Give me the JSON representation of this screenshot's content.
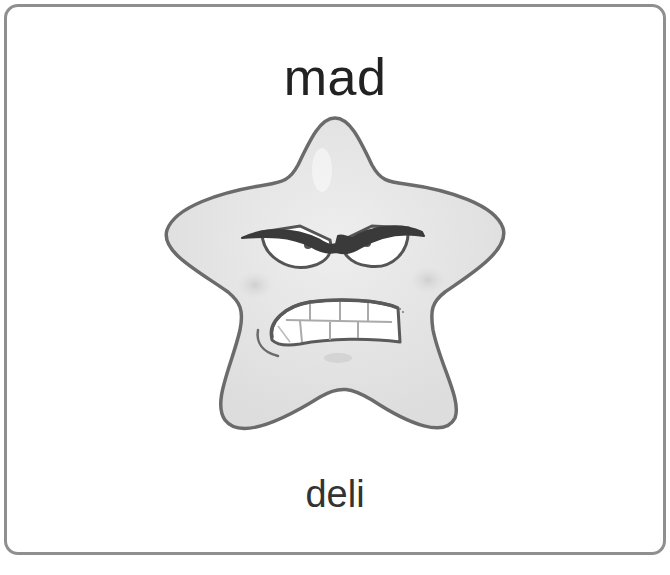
{
  "card": {
    "title": "mad",
    "subtitle": "deli",
    "border_color": "#8f8f8f",
    "background": "#ffffff"
  },
  "illustration": {
    "subject": "angry-star-character",
    "icon": "angry-star-icon",
    "fill_color": "#e6e6e6",
    "outline_color": "#6b6b6b",
    "expression": "mad"
  }
}
